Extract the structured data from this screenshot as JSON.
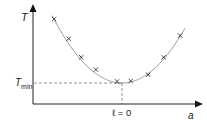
{
  "chart_data": {
    "type": "line",
    "title": "",
    "xlabel": "a",
    "ylabel": "T",
    "ymin_label": {
      "main": "T",
      "sub": "min"
    },
    "x_marker_label": "ℓ = 0",
    "x": [
      -0.7,
      -0.55,
      -0.42,
      -0.27,
      -0.05,
      0.09,
      0.27,
      0.43,
      0.6
    ],
    "series": [
      {
        "name": "measurements",
        "marker": "x",
        "values": [
          6.2,
          4.3,
          2.5,
          1.3,
          0.15,
          0.2,
          0.8,
          2.5,
          4.6
        ]
      },
      {
        "name": "fit",
        "marker": "none",
        "kind": "parabola",
        "vertex_x": 0,
        "vertex_y": 0
      }
    ],
    "colors": {
      "axis": "#222222",
      "curve": "#888888",
      "marker": "#333333",
      "dashed": "#777777"
    }
  }
}
